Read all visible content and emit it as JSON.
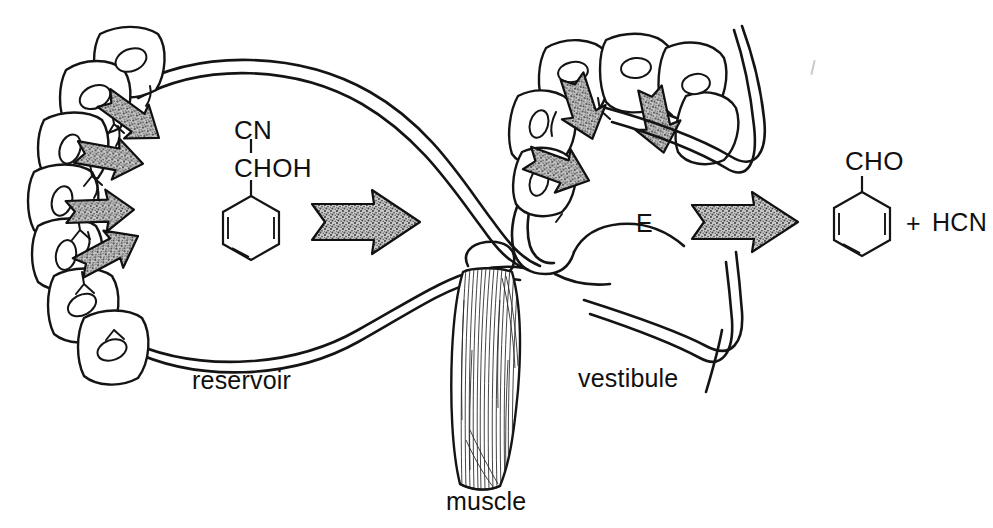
{
  "figure": {
    "kind": "biological-schematic",
    "background_color": "#ffffff",
    "ink_color": "#141414",
    "arrow_fill_color": "#9a9a9a"
  },
  "labels": {
    "reservoir": "reservoir",
    "vestibule": "vestibule",
    "muscle": "muscle",
    "enzyme": "E"
  },
  "chemistry": {
    "substrate": {
      "name_parts": {
        "nitrile_group": "CN",
        "carbinol_group": "CHOH"
      },
      "ring": "benzene"
    },
    "products": {
      "aldehyde_group": "CHO",
      "ring": "benzene",
      "plus_sign": "+",
      "hydrogen_cyanide": "HCN"
    }
  },
  "structures": {
    "gland_cells_left_count": 7,
    "gland_cells_right_count": 6,
    "secretion_arrows_left_count": 4,
    "secretion_arrows_right_count": 3,
    "flow_arrows_count": 2
  }
}
